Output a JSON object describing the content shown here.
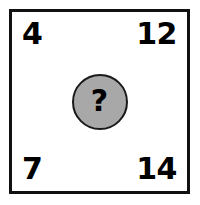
{
  "puzzle": {
    "type": "number-grid-puzzle",
    "corners": {
      "top_left": "4",
      "top_right": "12",
      "bottom_left": "7",
      "bottom_right": "14"
    },
    "center": {
      "label": "?",
      "icon": "question-mark-icon",
      "fill_color": "#a8a8a8",
      "border_color": "#1a1a1a"
    },
    "frame": {
      "border_color": "#111111",
      "background_color": "#ffffff"
    }
  }
}
